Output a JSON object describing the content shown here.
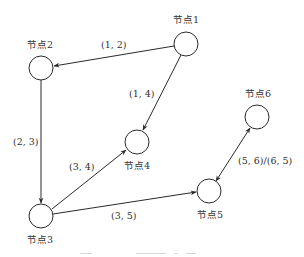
{
  "diagram": {
    "type": "directed-graph",
    "nodes": [
      {
        "id": "1",
        "label": "节点1",
        "x": 186,
        "y": 44
      },
      {
        "id": "2",
        "label": "节点2",
        "x": 41,
        "y": 68
      },
      {
        "id": "3",
        "label": "节点3",
        "x": 41,
        "y": 216
      },
      {
        "id": "4",
        "label": "节点4",
        "x": 137,
        "y": 142
      },
      {
        "id": "5",
        "label": "节点5",
        "x": 209,
        "y": 191
      },
      {
        "id": "6",
        "label": "节点6",
        "x": 257,
        "y": 117
      }
    ],
    "edges": [
      {
        "from": "1",
        "to": "2",
        "label": "(1, 2)",
        "direction": "forward"
      },
      {
        "from": "1",
        "to": "4",
        "label": "(1, 4)",
        "direction": "forward"
      },
      {
        "from": "2",
        "to": "3",
        "label": "(2, 3)",
        "direction": "forward"
      },
      {
        "from": "3",
        "to": "4",
        "label": "(3, 4)",
        "direction": "forward"
      },
      {
        "from": "3",
        "to": "5",
        "label": "(3, 5)",
        "direction": "forward"
      },
      {
        "from": "5",
        "to": "6",
        "label": "(5, 6)/(6, 5)",
        "direction": "both"
      }
    ]
  }
}
